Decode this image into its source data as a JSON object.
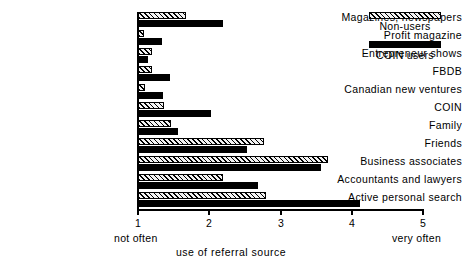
{
  "chart_data": {
    "type": "bar",
    "orientation": "horizontal",
    "title": "",
    "xlabel": "use of referral source",
    "ylabel": "",
    "xlim": [
      1,
      5
    ],
    "xticks": [
      1,
      2,
      3,
      4,
      5
    ],
    "xtick_labels": [
      "1",
      "2",
      "3",
      "4",
      "5"
    ],
    "x_anchor_low": "not often",
    "x_anchor_high": "very often",
    "grid": false,
    "legend_position": "top-right",
    "categories": [
      "Magazines, newspapers",
      "Profit magazine",
      "Entrepreneur shows",
      "FBDB",
      "Canadian new ventures",
      "COIN",
      "Family",
      "Friends",
      "Business associates",
      "Accountants and lawyers",
      "Active personal search"
    ],
    "series": [
      {
        "name": "Non-users",
        "fill": "hatched",
        "color": "#000000",
        "values": [
          1.67,
          1.08,
          1.2,
          1.2,
          1.1,
          1.37,
          1.46,
          2.77,
          3.67,
          2.19,
          2.8
        ]
      },
      {
        "name": "COIN users",
        "fill": "solid",
        "color": "#000000",
        "values": [
          2.19,
          1.34,
          1.14,
          1.45,
          1.35,
          2.03,
          1.56,
          2.53,
          3.57,
          2.68,
          4.12
        ]
      }
    ]
  },
  "legend": {
    "entries": [
      {
        "label": "Non-users",
        "swatch": "hatched-swatch"
      },
      {
        "label": "COIN users",
        "swatch": "solid-swatch"
      }
    ]
  }
}
